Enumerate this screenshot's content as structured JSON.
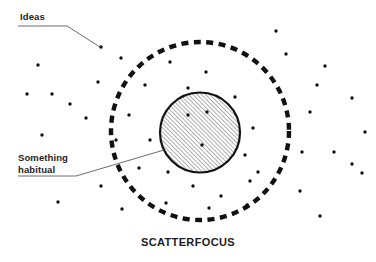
{
  "diagram": {
    "caption": "SCATTERFOCUS",
    "background_color": "#ffffff",
    "ink_color": "#1a1a1a",
    "labels": [
      {
        "id": "ideas",
        "text": "Ideas",
        "underline": {
          "x1": 18,
          "y1": 26,
          "x2": 67,
          "y2": 26
        },
        "leader": {
          "x1": 67,
          "y1": 26,
          "x2": 100,
          "y2": 47
        },
        "target_dot": {
          "x": 101,
          "y": 47
        }
      },
      {
        "id": "something-habitual",
        "text": "Something\nhabitual",
        "line1": "Something",
        "line2": "habitual",
        "underline": {
          "x1": 18,
          "y1": 176,
          "x2": 76,
          "y2": 176
        },
        "leader": {
          "x1": 76,
          "y1": 176,
          "x2": 164,
          "y2": 150
        }
      }
    ],
    "outer_circle": {
      "name": "dashed-attention-boundary",
      "cx": 200,
      "cy": 131,
      "r": 89,
      "stroke": "#111111",
      "stroke_width": 4.4,
      "dash": "7 5.5",
      "style": "dashed"
    },
    "inner_circle": {
      "name": "hatched-focus-core",
      "cx": 200,
      "cy": 132.5,
      "r": 40,
      "stroke": "#111111",
      "stroke_width": 2.2,
      "fill": "hatch-45",
      "hatch_color": "#6a6a6a",
      "hatch_spacing": 3,
      "style": "solid"
    },
    "dots": {
      "radius": 1.7,
      "color": "#111111",
      "inside_core": [
        {
          "x": 188,
          "y": 115
        },
        {
          "x": 207,
          "y": 112
        },
        {
          "x": 202,
          "y": 145
        }
      ],
      "between_circles": [
        {
          "x": 170,
          "y": 62
        },
        {
          "x": 206,
          "y": 72
        },
        {
          "x": 145,
          "y": 85
        },
        {
          "x": 188,
          "y": 88
        },
        {
          "x": 235,
          "y": 97
        },
        {
          "x": 253,
          "y": 128
        },
        {
          "x": 150,
          "y": 140
        },
        {
          "x": 245,
          "y": 155
        },
        {
          "x": 139,
          "y": 168
        },
        {
          "x": 168,
          "y": 172
        },
        {
          "x": 250,
          "y": 181
        },
        {
          "x": 193,
          "y": 186
        },
        {
          "x": 221,
          "y": 196
        },
        {
          "x": 166,
          "y": 203
        },
        {
          "x": 209,
          "y": 208
        },
        {
          "x": 247,
          "y": 205
        },
        {
          "x": 258,
          "y": 172
        },
        {
          "x": 129,
          "y": 115
        }
      ],
      "outside": [
        {
          "x": 101,
          "y": 47
        },
        {
          "x": 98,
          "y": 82
        },
        {
          "x": 38,
          "y": 65
        },
        {
          "x": 27,
          "y": 94
        },
        {
          "x": 52,
          "y": 94
        },
        {
          "x": 70,
          "y": 104
        },
        {
          "x": 86,
          "y": 118
        },
        {
          "x": 42,
          "y": 135
        },
        {
          "x": 101,
          "y": 186
        },
        {
          "x": 58,
          "y": 202
        },
        {
          "x": 122,
          "y": 209
        },
        {
          "x": 116,
          "y": 140
        },
        {
          "x": 121,
          "y": 58
        },
        {
          "x": 286,
          "y": 54
        },
        {
          "x": 325,
          "y": 66
        },
        {
          "x": 317,
          "y": 85
        },
        {
          "x": 352,
          "y": 98
        },
        {
          "x": 320,
          "y": 216
        },
        {
          "x": 289,
          "y": 134
        },
        {
          "x": 365,
          "y": 132
        },
        {
          "x": 362,
          "y": 173
        },
        {
          "x": 302,
          "y": 152
        },
        {
          "x": 334,
          "y": 152
        },
        {
          "x": 352,
          "y": 164
        },
        {
          "x": 300,
          "y": 191
        },
        {
          "x": 310,
          "y": 112
        },
        {
          "x": 276,
          "y": 31
        }
      ]
    }
  }
}
